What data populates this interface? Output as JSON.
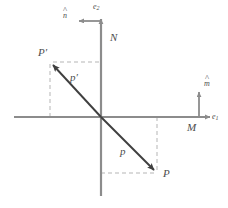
{
  "figure": {
    "type": "vector-diagram",
    "title": "",
    "colors": {
      "axis": "#8c8c8c",
      "vector": "#3f3f3f",
      "dashed": "#b0b0b0",
      "label": "#4d4d4d",
      "background": "#ffffff"
    },
    "axes": {
      "horizontal": {
        "name": "horizontal-axis",
        "from_x": 14,
        "to_x": 216,
        "y": 117,
        "arrow_end": "right"
      },
      "vertical": {
        "name": "vertical-axis",
        "x": 101,
        "from_y": 196,
        "to_y": 14,
        "arrow_end": "top"
      },
      "origin": {
        "x": 101,
        "y": 117
      }
    },
    "labels": {
      "e1": "e",
      "e1_sub": "1",
      "e2": "e",
      "e2_sub": "2",
      "m_hat": "m",
      "n_hat": "n",
      "plane_M": "M",
      "plane_N": "N",
      "point_P": "P",
      "point_P_prime": "P′",
      "vector_p": "p",
      "vector_p_prime": "p′"
    },
    "vectors": [
      {
        "name": "vector-p",
        "label": "p",
        "from": {
          "x": 101,
          "y": 117
        },
        "to": {
          "x": 157,
          "y": 173
        },
        "label_pos": {
          "x": 123,
          "y": 152
        }
      },
      {
        "name": "vector-p-prime",
        "label": "p′",
        "from": {
          "x": 101,
          "y": 117
        },
        "to": {
          "x": 50,
          "y": 62
        },
        "label_pos": {
          "x": 74,
          "y": 78
        }
      }
    ],
    "normals": [
      {
        "name": "normal-m-hat",
        "label": "m",
        "base": {
          "x": 199,
          "y": 117
        },
        "tip": {
          "x": 199,
          "y": 88
        },
        "direction": "up"
      },
      {
        "name": "normal-n-hat",
        "label": "n",
        "base": {
          "x": 101,
          "y": 21
        },
        "tip": {
          "x": 75,
          "y": 21
        },
        "direction": "left"
      }
    ],
    "points": [
      {
        "name": "point-P",
        "label": "P",
        "x": 157,
        "y": 173,
        "label_pos": {
          "x": 163,
          "y": 175
        }
      },
      {
        "name": "point-P-prime",
        "label": "P′",
        "x": 50,
        "y": 62,
        "label_pos": {
          "x": 41,
          "y": 54
        }
      }
    ],
    "guides": [
      {
        "name": "guide-P-vertical",
        "x1": 157,
        "y1": 117,
        "x2": 157,
        "y2": 173
      },
      {
        "name": "guide-P-horizontal",
        "x1": 101,
        "y1": 173,
        "x2": 157,
        "y2": 173
      },
      {
        "name": "guide-Pprime-vertical",
        "x1": 50,
        "y1": 62,
        "x2": 50,
        "y2": 117
      },
      {
        "name": "guide-Pprime-horizontal",
        "x1": 50,
        "y1": 62,
        "x2": 101,
        "y2": 62
      }
    ],
    "text_positions": {
      "e1": {
        "x": 212,
        "y": 114
      },
      "e2": {
        "x": 94,
        "y": 4
      },
      "m_hat": {
        "x": 205,
        "y": 81
      },
      "n_hat": {
        "x": 64,
        "y": 13
      },
      "plane_M": {
        "x": 188,
        "y": 123
      },
      "plane_N": {
        "x": 111,
        "y": 33
      }
    }
  }
}
